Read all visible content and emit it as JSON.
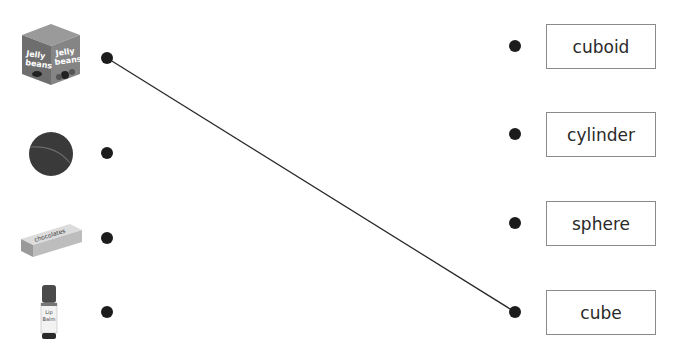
{
  "activity": "match-3d-shapes",
  "objects": [
    {
      "id": "jelly-bean-box",
      "icon": "jelly-beans-box-icon",
      "caption_lines": [
        "Jelly",
        "beans"
      ]
    },
    {
      "id": "ball",
      "icon": "ball-icon"
    },
    {
      "id": "chocolate-bar",
      "icon": "chocolate-box-icon",
      "caption": "chocolates"
    },
    {
      "id": "lip-balm",
      "icon": "lip-balm-icon",
      "caption_lines": [
        "Lip",
        "Balm"
      ]
    }
  ],
  "labels": [
    {
      "text": "cuboid"
    },
    {
      "text": "cylinder"
    },
    {
      "text": "sphere"
    },
    {
      "text": "cube"
    }
  ],
  "connections": [
    {
      "from_object": 0,
      "to_label": 3
    }
  ],
  "colors": {
    "dot": "#1c1c1c",
    "line": "#2a2a2a",
    "box_border": "#8a8a8a"
  }
}
